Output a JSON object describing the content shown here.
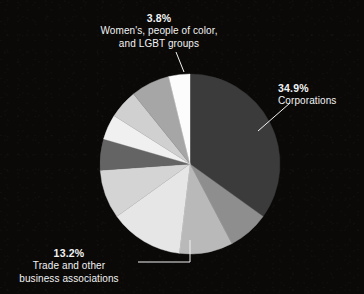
{
  "chart_data": {
    "type": "pie",
    "title": "",
    "subtitle": "",
    "xlabel": "",
    "ylabel": "",
    "legend_position": "none",
    "grid": false,
    "units": "percent",
    "background_color": "#0a0908",
    "label_color": "#f2f2f2",
    "start_angle_deg": 0,
    "direction": "clockwise",
    "center": {
      "x": 190,
      "y": 164
    },
    "radius": 90,
    "categories": [
      "Corporations",
      "",
      "",
      "Trade and other business associations",
      "",
      "",
      "",
      "",
      "",
      "Women's, people of color, and LGBT groups"
    ],
    "values": [
      34.9,
      7.4,
      9.6,
      13.2,
      8.8,
      5.6,
      4.5,
      5.2,
      7.0,
      3.8
    ],
    "slice_colors": [
      "#3b3b3b",
      "#8e8e8e",
      "#b9b9b9",
      "#e6e6e6",
      "#d4d4d4",
      "#646464",
      "#f0f0f0",
      "#d0d0d0",
      "#a6a6a6",
      "#fcfcfc"
    ],
    "labeled_slices": [
      {
        "index": 0,
        "percent": "34.9%",
        "category": "Corporations"
      },
      {
        "index": 3,
        "percent": "13.2%",
        "category": "Trade and other\nbusiness associations"
      },
      {
        "index": 9,
        "percent": "3.8%",
        "category": "Women's, people of color,\nand LGBT groups"
      }
    ]
  },
  "callouts": {
    "women": {
      "percent": "3.8%",
      "category": "Women's, people of color,\nand LGBT groups"
    },
    "corporations": {
      "percent": "34.9%",
      "category": "Corporations"
    },
    "trade": {
      "percent": "13.2%",
      "category": "Trade and other\nbusiness associations"
    }
  }
}
